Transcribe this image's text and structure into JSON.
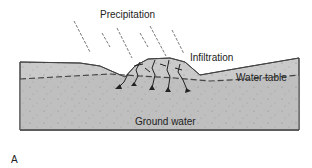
{
  "diagram": {
    "panel_label": "A",
    "labels": {
      "precipitation": "Precipitation",
      "infiltration": "Infiltration",
      "water_table": "Water table",
      "ground_water": "Ground water"
    },
    "colors": {
      "unsaturated_zone": "#c9c9c9",
      "saturated_zone": "#bdbdbd",
      "outline": "#444444",
      "text": "#222222"
    }
  }
}
